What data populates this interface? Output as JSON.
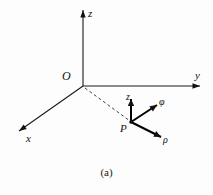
{
  "figure": {
    "caption": "(a)",
    "caption_top": 166,
    "background_color": "#fdfdfd",
    "ink_color": "#111111",
    "width": 213,
    "height": 195
  },
  "origin": {
    "label": "O",
    "x": 83,
    "y": 86,
    "label_left": 62,
    "label_top": 70
  },
  "axes": [
    {
      "name": "z-axis",
      "label": "z",
      "from_x": 83,
      "from_y": 86,
      "to_x": 83,
      "to_y": 10,
      "label_left": 88,
      "label_top": 8
    },
    {
      "name": "y-axis",
      "label": "y",
      "from_x": 83,
      "from_y": 86,
      "to_x": 200,
      "to_y": 86,
      "label_left": 195,
      "label_top": 70
    },
    {
      "name": "x-axis",
      "label": "x",
      "from_x": 83,
      "from_y": 86,
      "to_x": 19,
      "to_y": 131,
      "label_left": 26,
      "label_top": 133
    }
  ],
  "point": {
    "label": "P",
    "x": 131,
    "y": 122,
    "label_left": 120,
    "label_top": 123
  },
  "radial_line": {
    "name": "origin-to-point-dashed",
    "from_x": 85,
    "from_y": 88,
    "to_x": 130,
    "to_y": 121
  },
  "unit_vectors": [
    {
      "name": "z-unit-vector",
      "label": "z",
      "from_x": 131,
      "from_y": 122,
      "to_x": 131,
      "to_y": 99,
      "label_left": 126,
      "label_top": 92
    },
    {
      "name": "phi-unit-vector",
      "label": "φ",
      "from_x": 131,
      "from_y": 122,
      "to_x": 157,
      "to_y": 105,
      "label_left": 159,
      "label_top": 97
    },
    {
      "name": "rho-unit-vector",
      "label": "ρ",
      "from_x": 131,
      "from_y": 122,
      "to_x": 161,
      "to_y": 137,
      "label_left": 163,
      "label_top": 135
    }
  ]
}
